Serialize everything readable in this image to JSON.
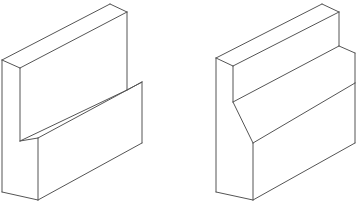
{
  "document": {
    "title": "Isometric Technical Drawings",
    "description": "Two isometric line drawings of block-shaped solids",
    "background_color": "#ffffff",
    "line_color": "#555555",
    "face_color": "#ffffff",
    "line_width": 1,
    "canvas_width": 361,
    "canvas_height": 207
  },
  "figures": [
    {
      "id": "figure-left",
      "name": "stepped-block-square-notch",
      "label": "Left isometric block with rectangular step notch",
      "faces": [
        {
          "name": "tall-back-wall-top-face",
          "points": "2,60 110,4 127,12 20,68"
        },
        {
          "name": "tall-back-wall-front-face",
          "points": "20,68 127,12 127,90 20,141"
        },
        {
          "name": "tall-back-wall-left-face",
          "points": "2,60 20,68 20,141 2,133"
        },
        {
          "name": "step-top-face",
          "points": "20,141 127,90 142,82 38,138"
        },
        {
          "name": "step-front-face",
          "points": "38,138 142,82 142,143 38,200"
        },
        {
          "name": "base-left-face",
          "points": "2,133 20,141 38,138 38,200 20,200 2,192"
        }
      ],
      "edges": [
        {
          "name": "top-face-left-edge",
          "path": "M 2,60 L 110,4"
        },
        {
          "name": "top-face-back-edge",
          "path": "M 110,4 L 127,12"
        },
        {
          "name": "top-face-front-edge",
          "path": "M 127,12 L 20,68"
        },
        {
          "name": "top-face-near-left-edge",
          "path": "M 20,68 L 2,60"
        },
        {
          "name": "back-wall-right-vertical-edge",
          "path": "M 127,12 L 127,90"
        },
        {
          "name": "back-wall-inner-vertical-edge",
          "path": "M 20,68 L 20,141"
        },
        {
          "name": "outer-left-vertical-edge",
          "path": "M 2,60 L 2,192"
        },
        {
          "name": "step-inner-top-edge",
          "path": "M 20,141 L 127,90"
        },
        {
          "name": "step-top-right-edge",
          "path": "M 127,90 L 142,82"
        },
        {
          "name": "step-top-front-edge",
          "path": "M 142,82 L 38,138"
        },
        {
          "name": "step-top-left-edge",
          "path": "M 38,138 L 20,141"
        },
        {
          "name": "step-front-left-vertical-edge",
          "path": "M 38,138 L 38,200"
        },
        {
          "name": "step-front-right-vertical-edge",
          "path": "M 142,82 L 142,143"
        },
        {
          "name": "bottom-front-right-edge",
          "path": "M 38,200 L 142,143"
        },
        {
          "name": "bottom-left-edge",
          "path": "M 2,192 L 38,200"
        }
      ]
    },
    {
      "id": "figure-right",
      "name": "stepped-block-chamfered-notch",
      "label": "Right isometric block with chamfered step notch",
      "faces": [
        {
          "name": "tall-back-wall-top-face",
          "points": "216,58 322,4 339,12 233,66"
        },
        {
          "name": "tall-back-wall-front-face",
          "points": "233,66 339,12 339,46 233,102"
        },
        {
          "name": "tall-back-wall-left-face",
          "points": "216,58 233,66 233,102 216,94"
        },
        {
          "name": "chamfer-slope-face",
          "points": "233,102 339,46 355,53 253,143"
        },
        {
          "name": "step-front-face",
          "points": "253,143 355,83 355,143 253,200"
        },
        {
          "name": "base-left-face",
          "points": "216,94 233,102 253,143 253,200 233,200 216,192"
        }
      ],
      "edges": [
        {
          "name": "top-face-left-edge",
          "path": "M 216,58 L 322,4"
        },
        {
          "name": "top-face-back-edge",
          "path": "M 322,4 L 339,12"
        },
        {
          "name": "top-face-front-edge",
          "path": "M 339,12 L 233,66"
        },
        {
          "name": "top-face-near-left-edge",
          "path": "M 233,66 L 216,58"
        },
        {
          "name": "back-wall-right-vertical-edge",
          "path": "M 339,12 L 339,46"
        },
        {
          "name": "back-wall-inner-vertical-edge",
          "path": "M 233,66 L 233,102"
        },
        {
          "name": "outer-left-vertical-edge",
          "path": "M 216,58 L 216,192"
        },
        {
          "name": "chamfer-top-inner-edge",
          "path": "M 233,102 L 339,46"
        },
        {
          "name": "chamfer-top-right-edge",
          "path": "M 339,46 L 355,53"
        },
        {
          "name": "chamfer-slope-right-edge",
          "path": "M 355,53 L 355,83"
        },
        {
          "name": "chamfer-slope-front-edge",
          "path": "M 355,83 L 253,143"
        },
        {
          "name": "chamfer-slope-left-edge",
          "path": "M 253,143 L 233,102"
        },
        {
          "name": "step-front-left-vertical-edge",
          "path": "M 253,143 L 253,200"
        },
        {
          "name": "step-front-right-vertical-edge",
          "path": "M 355,83 L 355,143"
        },
        {
          "name": "bottom-front-right-edge",
          "path": "M 253,200 L 355,143"
        },
        {
          "name": "bottom-left-edge",
          "path": "M 216,192 L 253,200"
        }
      ]
    }
  ]
}
